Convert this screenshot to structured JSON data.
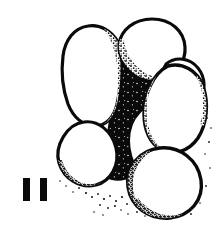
{
  "figure": {
    "label": "II",
    "label_kind": "roman-numeral",
    "view": "umbilical",
    "background_color": "#ffffff",
    "ink_color": "#0a0a0a",
    "stipple_color": "#111111",
    "chamber_fill": "#ffffff",
    "umbilicus_fill": "#0a0a0a",
    "chambers": [
      {
        "id": "chamber-upper-left",
        "position": "upper-left",
        "shape": "elongate-pear",
        "shading": "stipple-inner-right"
      },
      {
        "id": "chamber-top",
        "position": "top",
        "shape": "broad-ovate",
        "shading": "stipple-lower-left"
      },
      {
        "id": "chamber-upper-right",
        "position": "upper-right",
        "shape": "ovate",
        "shading": "stipple-inner-left"
      },
      {
        "id": "chamber-right",
        "position": "right",
        "shape": "large-ovate",
        "shading": "stipple-inner-left-and-base"
      },
      {
        "id": "chamber-lower-right",
        "position": "lower-right",
        "shape": "subglobular",
        "shading": "stipple-lower-left-arc"
      },
      {
        "id": "chamber-left",
        "position": "lower-left",
        "shape": "subglobular",
        "shading": "stipple-lower-right-arc"
      }
    ],
    "umbilicus": {
      "id": "umbilical-region",
      "description": "deep solid-black irregular central depression with fine white speckles"
    },
    "outline": {
      "stroke_weight_outer": 3.4,
      "stroke_weight_inner": 2.4
    }
  }
}
